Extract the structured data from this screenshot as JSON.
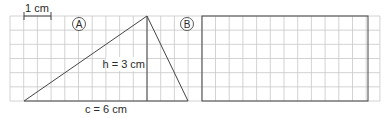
{
  "scale_label": "1 cm",
  "figure_a": {
    "label": "A",
    "height_label": "h = 3 cm",
    "base_label": "c = 6 cm",
    "height_cm": 3,
    "base_cm": 6
  },
  "figure_b": {
    "label": "B"
  },
  "grid": {
    "columns": 27,
    "rows": 6,
    "cells_per_cm": 2
  },
  "colors": {
    "grid": "#c8c8c8",
    "lines": "#444444",
    "text": "#2a2a2a"
  }
}
